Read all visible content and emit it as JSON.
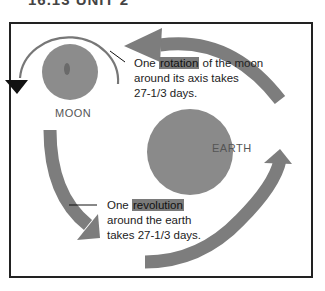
{
  "header_fragment": "16.13 UNIT 2",
  "diagram": {
    "moon_label": "MOON",
    "earth_label": "EARTH",
    "rotation_note": {
      "prefix": "One",
      "highlight": "rotation",
      "suffix": "of the moon",
      "line2": "around its axis takes",
      "line3": "27-1/3 days."
    },
    "revolution_note": {
      "prefix": "One",
      "highlight": "revolution",
      "line2": "around the earth",
      "line3": "takes 27-1/3 days."
    },
    "colors": {
      "body_fill": "#8a8a8a",
      "arrow_fill": "#7d7d7d",
      "frame": "#222222",
      "highlight": "#7a7a7a"
    }
  }
}
